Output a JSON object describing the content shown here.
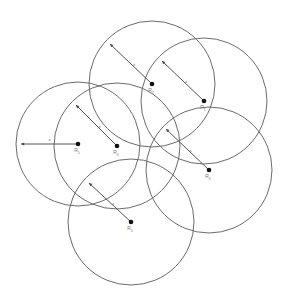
{
  "diagram": {
    "stroke_color": "#6b6b6b",
    "dot_color": "#111111",
    "radius_label": "x",
    "nodes": [
      {
        "id": "top-center",
        "label": "R",
        "sub": "2",
        "cx": 152,
        "cy": 84,
        "r": 63,
        "tip": [
          110,
          44
        ]
      },
      {
        "id": "top-right",
        "label": "R",
        "sub": "1",
        "cx": 204,
        "cy": 101,
        "r": 63,
        "tip": [
          162,
          61
        ]
      },
      {
        "id": "left",
        "label": "R",
        "sub": "5",
        "cx": 78,
        "cy": 144,
        "r": 62,
        "tip": [
          21,
          144
        ]
      },
      {
        "id": "center",
        "label": "R",
        "sub": "4",
        "cx": 117,
        "cy": 146,
        "r": 63,
        "tip": [
          76,
          105
        ]
      },
      {
        "id": "right",
        "label": "R",
        "sub": "6",
        "cx": 209,
        "cy": 170,
        "r": 63,
        "tip": [
          166,
          129
        ]
      },
      {
        "id": "bottom",
        "label": "R",
        "sub": "3",
        "cx": 131,
        "cy": 222,
        "r": 63,
        "tip": [
          89,
          183
        ]
      }
    ]
  }
}
